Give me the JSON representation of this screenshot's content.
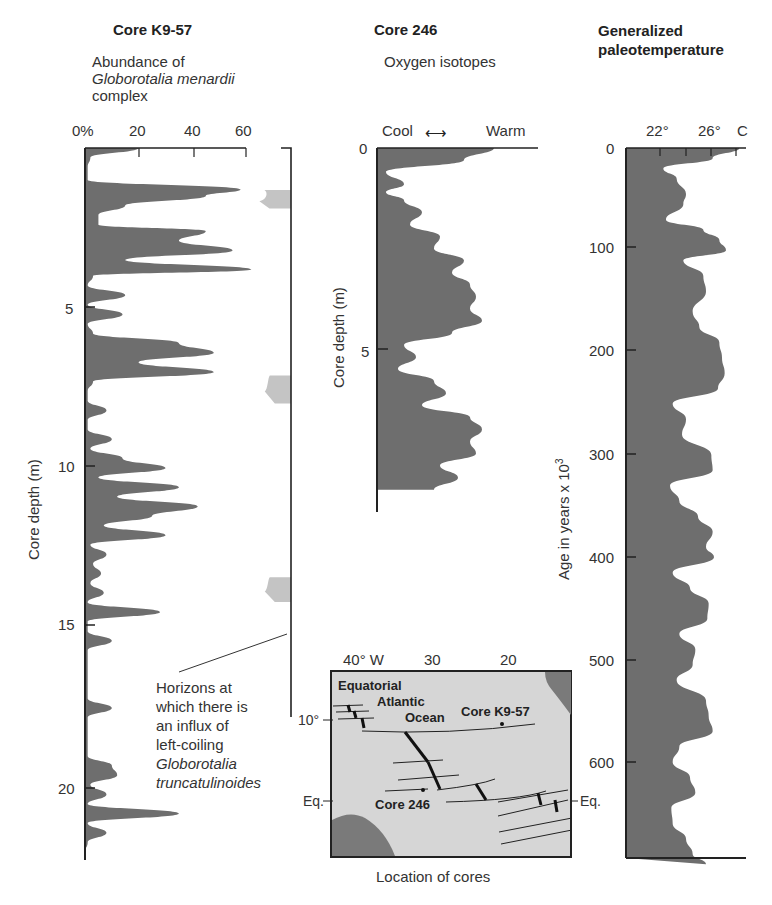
{
  "panels": {
    "k957": {
      "title": "Core K9-57",
      "subtitle_line1": "Abundance of",
      "subtitle_line2": "Globorotalia menardii",
      "subtitle_line3": "complex",
      "x_ticks": [
        "0%",
        "20",
        "40",
        "60"
      ],
      "y_label": "Core depth (m)",
      "y_ticks": [
        "5",
        "10",
        "15",
        "20"
      ]
    },
    "c246": {
      "title": "Core 246",
      "subtitle": "Oxygen isotopes",
      "x_left": "Cool",
      "x_right": "Warm",
      "y_label": "Core depth (m)",
      "y_ticks": [
        "0",
        "5"
      ]
    },
    "paleo": {
      "title_line1": "Generalized",
      "title_line2": "paleotemperature",
      "x_ticks": [
        "22°",
        "26°",
        "C"
      ],
      "y_label": "Age in years x 10",
      "y_label_sup": "3",
      "y_ticks": [
        "0",
        "100",
        "200",
        "300",
        "400",
        "500",
        "600"
      ]
    }
  },
  "annotation": {
    "line1": "Horizons at",
    "line2": "which there is",
    "line3": "an influx of",
    "line4": "left-coiling",
    "line5": "Globorotalia",
    "line6": "truncatulinoides"
  },
  "map": {
    "caption": "Location of cores",
    "lon_ticks": [
      "40° W",
      "30",
      "20"
    ],
    "lat_ticks": [
      "10°",
      "Eq.",
      "Eq."
    ],
    "ocean_line1": "Equatorial",
    "ocean_line2": "Atlantic",
    "ocean_line3": "Ocean",
    "core_a": "Core K9-57",
    "core_b": "Core 246"
  },
  "colors": {
    "fill_dark": "#6e6e6e",
    "fill_light": "#c4c4c4",
    "map_bg": "#d6d6d6",
    "land": "#7a7a7a"
  },
  "chart_data": [
    {
      "type": "area",
      "title": "Core K9-57 — Abundance of Globorotalia menardii complex",
      "xlabel": "Abundance (%)",
      "ylabel": "Core depth (m)",
      "xlim": [
        0,
        75
      ],
      "ylim": [
        0,
        22
      ],
      "orientation": "vertical-profile",
      "series": [
        {
          "name": "G. menardii abundance",
          "depth_m": [
            0,
            0.3,
            0.6,
            1.0,
            1.3,
            1.5,
            1.8,
            2.1,
            2.4,
            2.6,
            2.9,
            3.2,
            3.5,
            3.8,
            4.0,
            4.3,
            4.6,
            4.9,
            5.2,
            5.5,
            5.8,
            6.1,
            6.4,
            6.7,
            7.0,
            7.3,
            7.6,
            7.9,
            8.2,
            8.5,
            8.8,
            9.1,
            9.4,
            9.7,
            10.0,
            10.3,
            10.6,
            10.9,
            11.2,
            11.5,
            11.8,
            12.1,
            12.4,
            12.7,
            13.0,
            13.3,
            13.6,
            13.9,
            14.2,
            14.5,
            14.8,
            15.1,
            15.4,
            15.7,
            16.0,
            16.3,
            16.6,
            16.9,
            17.2,
            17.5,
            17.8,
            18.1,
            18.4,
            18.7,
            19.0,
            19.3,
            19.6,
            19.9,
            20.2,
            20.5,
            20.8,
            21.1,
            21.4,
            21.7,
            22.0
          ],
          "abundance_pct": [
            20,
            2,
            1,
            1,
            58,
            45,
            15,
            5,
            5,
            45,
            35,
            55,
            15,
            62,
            3,
            1,
            15,
            1,
            14,
            1,
            3,
            35,
            48,
            20,
            48,
            3,
            1,
            1,
            8,
            1,
            1,
            10,
            2,
            14,
            30,
            5,
            35,
            12,
            42,
            25,
            7,
            30,
            2,
            8,
            3,
            6,
            2,
            7,
            1,
            28,
            1,
            1,
            10,
            1,
            1,
            1,
            1,
            1,
            1,
            10,
            1,
            1,
            1,
            1,
            1,
            10,
            12,
            2,
            8,
            1,
            35,
            1,
            8,
            1,
            0
          ]
        },
        {
          "name": "G. truncatulinoides left-coiling influx horizons",
          "depth_m": [
            1.5,
            1.7,
            7.3,
            7.8,
            13.6,
            14.0
          ],
          "abundance_pct": [
            70,
            65,
            70,
            67,
            70,
            67
          ]
        }
      ]
    },
    {
      "type": "area",
      "title": "Core 246 — Oxygen isotopes",
      "xlabel": "Cool ↔ Warm",
      "ylabel": "Core depth (m)",
      "ylim": [
        0,
        8.5
      ],
      "series": [
        {
          "name": "relative warmth (0=cool,1=warm)",
          "depth_m": [
            0,
            0.3,
            0.6,
            0.9,
            1.1,
            1.3,
            1.6,
            1.9,
            2.2,
            2.5,
            2.8,
            3.1,
            3.4,
            3.7,
            4.0,
            4.3,
            4.6,
            4.9,
            5.2,
            5.5,
            5.8,
            6.1,
            6.4,
            6.7,
            7.0,
            7.3,
            7.6,
            7.9,
            8.2,
            8.5
          ],
          "warmth": [
            0.95,
            0.7,
            0.05,
            0.2,
            0.05,
            0.2,
            0.35,
            0.25,
            0.5,
            0.45,
            0.7,
            0.6,
            0.75,
            0.8,
            0.75,
            0.85,
            0.6,
            0.2,
            0.3,
            0.15,
            0.45,
            0.55,
            0.35,
            0.75,
            0.85,
            0.75,
            0.8,
            0.5,
            0.65,
            0.45
          ]
        }
      ]
    },
    {
      "type": "area",
      "title": "Generalized paleotemperature",
      "xlabel": "Temperature (°C)",
      "ylabel": "Age in years x 10^3",
      "xlim": [
        19,
        28
      ],
      "ylim": [
        0,
        700
      ],
      "x_ticks": [
        22,
        26
      ],
      "series": [
        {
          "name": "paleotemperature",
          "age_ka": [
            0,
            10,
            20,
            30,
            45,
            55,
            70,
            80,
            90,
            100,
            110,
            125,
            140,
            160,
            175,
            190,
            205,
            220,
            235,
            250,
            265,
            280,
            300,
            315,
            330,
            345,
            360,
            375,
            390,
            400,
            415,
            430,
            445,
            460,
            475,
            490,
            505,
            520,
            540,
            555,
            570,
            585,
            600,
            615,
            630,
            645,
            660,
            675,
            690,
            700
          ],
          "temp_c": [
            27.5,
            25.5,
            21.8,
            22.8,
            23.5,
            23.3,
            22.0,
            24.8,
            26.0,
            26.5,
            23.3,
            24.8,
            25.0,
            24.0,
            24.5,
            26.0,
            26.2,
            26.4,
            25.9,
            22.5,
            23.5,
            23.2,
            25.4,
            25.5,
            22.3,
            23.0,
            24.4,
            25.5,
            25.0,
            25.6,
            22.5,
            23.8,
            25.2,
            25.1,
            23.0,
            24.2,
            24.0,
            22.8,
            25.0,
            25.2,
            25.5,
            23.0,
            22.5,
            23.8,
            24.2,
            22.4,
            22.5,
            23.5,
            24.0,
            25.0
          ]
        }
      ]
    }
  ]
}
